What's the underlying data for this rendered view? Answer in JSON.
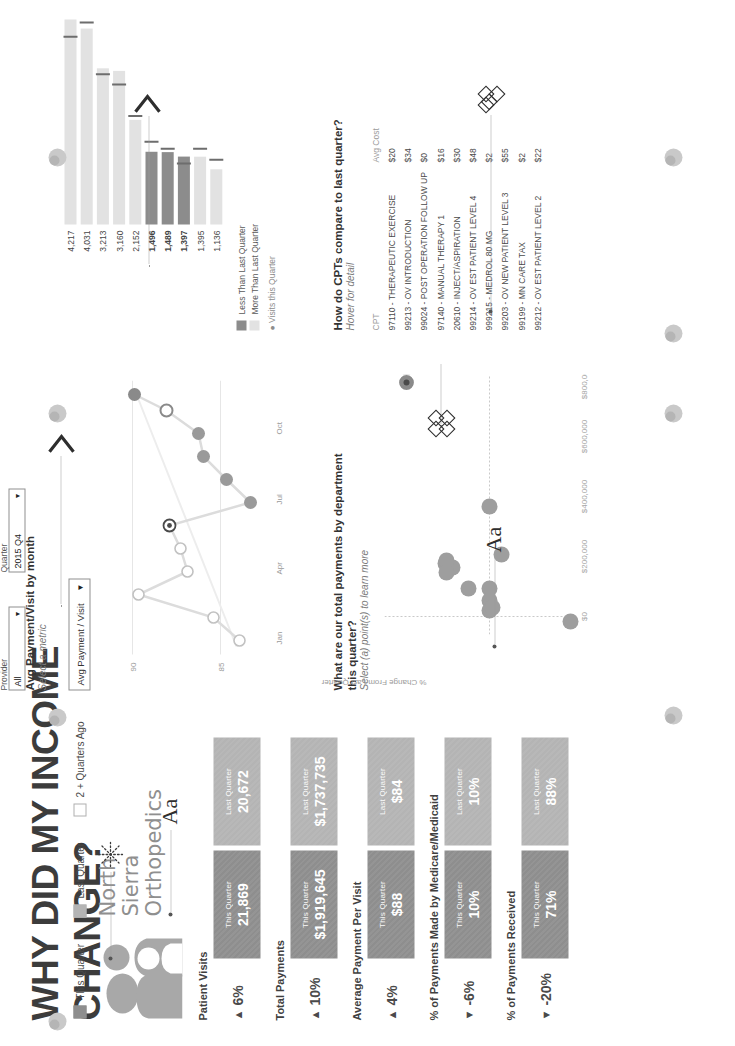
{
  "header": {
    "title": "WHY DID MY INCOME CHANGE?",
    "legend": [
      {
        "label": "This Quarter",
        "color": "#8e8e8e"
      },
      {
        "label": "Last Quarter",
        "color": "#b4b4b4"
      },
      {
        "label": "2 + Quarters Ago",
        "color": "#ffffff"
      }
    ],
    "practice_name": [
      "North",
      "Sierra",
      "Orthopedics"
    ],
    "logo_icon": "people-group-icon"
  },
  "filters": [
    {
      "name": "Provider",
      "value": "All",
      "icon": "chevron-down-icon"
    },
    {
      "name": "Quarter",
      "value": "2015 Q4",
      "icon": "chevron-down-icon"
    }
  ],
  "kpis": [
    {
      "label": "Patient Visits",
      "delta": "6%",
      "direction": "up",
      "this_label": "This Quarter",
      "this_value": "21,869",
      "last_label": "Last Quarter",
      "last_value": "20,672"
    },
    {
      "label": "Total Payments",
      "delta": "10%",
      "direction": "up",
      "this_label": "This Quarter",
      "this_value": "$1,919,645",
      "last_label": "Last Quarter",
      "last_value": "$1,737,735"
    },
    {
      "label": "Average Payment Per Visit",
      "delta": "4%",
      "direction": "up",
      "this_label": "This Quarter",
      "this_value": "$88",
      "last_label": "Last Quarter",
      "last_value": "$84"
    },
    {
      "label": "% of Payments Made by Medicare/Medicaid",
      "delta": "-6%",
      "direction": "down",
      "this_label": "This Quarter",
      "this_value": "10%",
      "last_label": "Last Quarter",
      "last_value": "10%"
    },
    {
      "label": "% of Payments Received",
      "delta": "-20%",
      "direction": "down",
      "this_label": "This Quarter",
      "this_value": "71%",
      "last_label": "Last Quarter",
      "last_value": "88%"
    }
  ],
  "line_panel": {
    "title": "Avg Payment/Visit by month",
    "subtitle": "Select a metric",
    "metric_selected": "Avg Payment / Visit",
    "dropdown_icon": "chevron-down-icon"
  },
  "scatter_panel": {
    "title": "What are our total payments by department this quarter?",
    "subtitle": "Select (a) point(s) to learn more",
    "ylabel": "% Change From Last Quarter"
  },
  "cpt_panel": {
    "title": "How do CPTs compare to last quarter?",
    "subtitle": "Hover for detail",
    "columns": [
      "CPT",
      "Avg Cost",
      "Visits this Quarter"
    ]
  },
  "bar_panel": {
    "legend": [
      {
        "label": "Less Than Last Quarter",
        "color": "#8c8c8c"
      },
      {
        "label": "More Than Last Quarter",
        "color": "#e2e2e2"
      }
    ]
  },
  "annotations": [
    {
      "icon": "asterisk-icon",
      "name": "annotation-asterisk"
    },
    {
      "icon": "text-style-icon",
      "name": "annotation-aa-1",
      "label": "Aa"
    },
    {
      "icon": "text-style-icon",
      "name": "annotation-aa-2",
      "label": "Aa"
    },
    {
      "icon": "quatrefoil-icon",
      "name": "annotation-quatrefoil-1"
    },
    {
      "icon": "quatrefoil-icon",
      "name": "annotation-quatrefoil-2"
    },
    {
      "icon": "chevron-right-icon",
      "name": "annotation-chevron-1"
    },
    {
      "icon": "chevron-right-icon",
      "name": "annotation-chevron-2"
    },
    {
      "icon": "sphere-icon",
      "name": "annotation-sphere"
    }
  ],
  "chart_data": [
    {
      "type": "line",
      "title": "Avg Payment/Visit by month",
      "xlabel": "",
      "ylabel": "",
      "x": [
        "Jan",
        "Feb",
        "Mar",
        "Apr",
        "May",
        "Jun",
        "Jul",
        "Aug",
        "Sep",
        "Oct",
        "Nov",
        "Dec"
      ],
      "xticks": [
        "Jan",
        "Apr",
        "Jul",
        "Oct"
      ],
      "yticks": [
        85,
        90
      ],
      "ylim": [
        83.2,
        91.5
      ],
      "values": [
        84.6,
        86.1,
        90.4,
        87.6,
        88.0,
        88.6,
        84.0,
        85.4,
        86.7,
        87.0,
        88.8,
        90.6
      ],
      "series_name": "Avg Payment / Visit",
      "point_style": [
        "open",
        "open",
        "open",
        "open",
        "open",
        "selected",
        "filled",
        "filled",
        "filled",
        "filled",
        "open",
        "filled"
      ],
      "grid": false
    },
    {
      "type": "scatter",
      "title": "What are our total payments by department this quarter?",
      "xlabel": "",
      "ylabel": "% Change From Last Quarter",
      "xticks": [
        "$0",
        "$200,000",
        "$400,000",
        "$600,000",
        "$800,000"
      ],
      "yticks": [
        "-40%",
        "-20%",
        "0%",
        "20%",
        "40%"
      ],
      "xlim": [
        0,
        880000
      ],
      "ylim": [
        -0.5,
        0.5
      ],
      "points": [
        {
          "x": 810000,
          "y": 0.4,
          "selected": true
        },
        {
          "x": 385000,
          "y": 0.0
        },
        {
          "x": 178000,
          "y": 0.21
        },
        {
          "x": 172000,
          "y": 0.18
        },
        {
          "x": 185000,
          "y": 0.0
        },
        {
          "x": 205000,
          "y": -0.05
        },
        {
          "x": 150000,
          "y": -0.1
        },
        {
          "x": 92000,
          "y": 0.0
        },
        {
          "x": 52000,
          "y": -0.02
        },
        {
          "x": 30000,
          "y": 0.0
        },
        {
          "x": 38000,
          "y": 0.0
        },
        {
          "x": 14000,
          "y": -0.4
        }
      ]
    },
    {
      "type": "bar",
      "title": "How do CPTs compare to last quarter?",
      "xlabel": "",
      "ylabel": "Visits this Quarter",
      "categories": [
        "97110 - THERAPEUTIC EXERCISE",
        "99213 - OV INTRODUCTION",
        "99024 - POST OPERATION FOLLOW UP",
        "97140 - MANUAL THERAPY 1",
        "20610 - INJECT/ASPIRATION",
        "99214 - OV EST PATIENT LEVEL 4",
        "999215 - MEDROL 80 MG",
        "99203 - OV NEW PATIENT LEVEL 3",
        "99199 - MN CARE TAX",
        "99212 - OV EST PATIENT LEVEL 2"
      ],
      "values": [
        4217,
        4031,
        3213,
        3160,
        2152,
        1496,
        1489,
        1397,
        1395,
        1136
      ],
      "reference_values": [
        3860,
        4155,
        3090,
        2880,
        2230,
        1700,
        1560,
        1255,
        1560,
        1330
      ],
      "avg_cost": [
        "$20",
        "$34",
        "$0",
        "$16",
        "$30",
        "$48",
        "$2",
        "$55",
        "$2",
        "$22"
      ],
      "bar_colors": [
        "#e2e2e2",
        "#e2e2e2",
        "#e2e2e2",
        "#e2e2e2",
        "#e2e2e2",
        "#8c8c8c",
        "#8c8c8c",
        "#8c8c8c",
        "#e2e2e2",
        "#e2e2e2"
      ],
      "legend": [
        "Less Than Last Quarter",
        "More Than Last Quarter"
      ]
    }
  ],
  "colors": {
    "this_quarter": "#8e8e8e",
    "last_quarter": "#b4b4b4",
    "accent_dark": "#6f6f6f",
    "bar_light": "#e2e2e2",
    "bar_dark": "#8c8c8c",
    "text": "#3c3c3c"
  }
}
